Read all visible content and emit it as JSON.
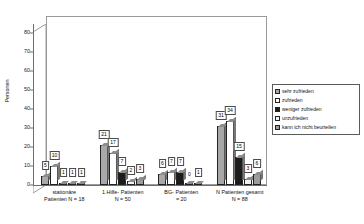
{
  "chart_data": {
    "type": "bar",
    "title": "",
    "xlabel": "",
    "ylabel": "Personen",
    "ylim": [
      0,
      85
    ],
    "yticks": [
      0,
      10,
      20,
      30,
      40,
      50,
      60,
      70,
      80
    ],
    "grid": false,
    "legend_position": "right",
    "categories": [
      "stationäre Patienten N = 18",
      "1.Hilfe- Patienten N = 50",
      "BG- Patienten = 20",
      "N Patienten gesamt N = 88"
    ],
    "category_lines": [
      {
        "line1": "stationäre",
        "line2": "Patienten N = 18"
      },
      {
        "line1": "1.Hilfe- Patienten",
        "line2": "N = 50"
      },
      {
        "line1": "BG- Patienten",
        "line2": "= 20"
      },
      {
        "line1": "N Patienten gesamt",
        "line2": "N = 88"
      }
    ],
    "series": [
      {
        "name": "sehr zufrieden",
        "color": "#a8a8a8",
        "values": [
          5,
          21,
          6,
          31
        ]
      },
      {
        "name": "zufrieden",
        "color": "#ffffff",
        "values": [
          10,
          17,
          7,
          34
        ]
      },
      {
        "name": "weniger zufrieden",
        "color": "#1c1c1c",
        "values": [
          1,
          7,
          7,
          15
        ]
      },
      {
        "name": "unzufrieden",
        "color": "#f2f2f2",
        "values": [
          1,
          2,
          0,
          3
        ]
      },
      {
        "name": "kann ich nicht beurteilen",
        "color": "#9c9c9c",
        "values": [
          1,
          3,
          1,
          6
        ]
      }
    ]
  },
  "legend": {
    "items": [
      "sehr zufrieden",
      "zufrieden",
      "weniger zufrieden",
      "unzufrieden",
      "kann ich nicht beurteilen"
    ]
  }
}
